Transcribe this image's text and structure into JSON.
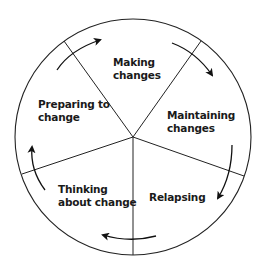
{
  "diagram": {
    "type": "cycle-wheel",
    "stages": [
      {
        "label": "Making changes",
        "lines": [
          "Making",
          "changes"
        ]
      },
      {
        "label": "Maintaining changes",
        "lines": [
          "Maintaining",
          "changes"
        ]
      },
      {
        "label": "Relapsing",
        "lines": [
          "Relapsing"
        ]
      },
      {
        "label": "Thinking about change",
        "lines": [
          "Thinking",
          "about change"
        ]
      },
      {
        "label": "Preparing to change",
        "lines": [
          "Preparing to",
          "change"
        ]
      }
    ],
    "direction": "clockwise",
    "colors": {
      "line": "#222222",
      "background": "#ffffff"
    }
  }
}
